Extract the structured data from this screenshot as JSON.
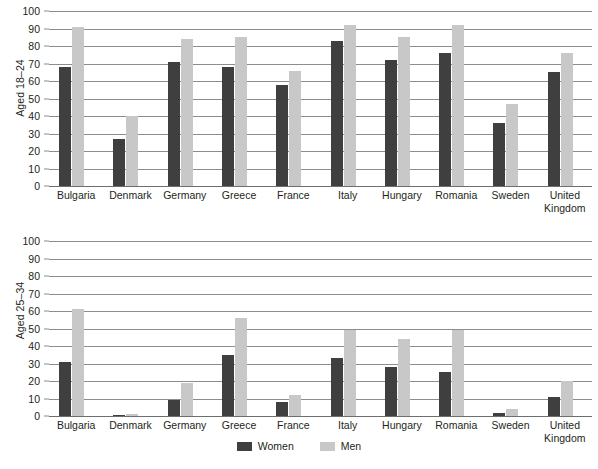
{
  "chart_data": [
    {
      "type": "bar",
      "title": "",
      "ylabel": "Aged 18–24",
      "xlabel": "",
      "ylim": [
        0,
        100
      ],
      "yticks": [
        0,
        10,
        20,
        30,
        40,
        50,
        60,
        70,
        80,
        90,
        100
      ],
      "grid": true,
      "categories": [
        "Bulgaria",
        "Denmark",
        "Germany",
        "Greece",
        "France",
        "Italy",
        "Hungary",
        "Romania",
        "Sweden",
        "United Kingdom"
      ],
      "series": [
        {
          "name": "Women",
          "color": "#3f3f3f",
          "values": [
            68,
            27,
            71,
            68,
            58,
            83,
            72,
            76,
            36,
            65
          ]
        },
        {
          "name": "Men",
          "color": "#c8c8c8",
          "values": [
            91,
            40,
            84,
            85,
            66,
            92,
            85,
            92,
            47,
            76
          ]
        }
      ]
    },
    {
      "type": "bar",
      "title": "",
      "ylabel": "Aged 25–34",
      "xlabel": "",
      "ylim": [
        0,
        100
      ],
      "yticks": [
        0,
        10,
        20,
        30,
        40,
        50,
        60,
        70,
        80,
        90,
        100
      ],
      "grid": true,
      "categories": [
        "Bulgaria",
        "Denmark",
        "Germany",
        "Greece",
        "France",
        "Italy",
        "Hungary",
        "Romania",
        "Sweden",
        "United Kingdom"
      ],
      "series": [
        {
          "name": "Women",
          "color": "#3f3f3f",
          "values": [
            31,
            0.5,
            9,
            35,
            8,
            33,
            28,
            25,
            2,
            11
          ]
        },
        {
          "name": "Men",
          "color": "#c8c8c8",
          "values": [
            61,
            1,
            19,
            56,
            12,
            49,
            44,
            49,
            4,
            20
          ]
        }
      ]
    }
  ],
  "legend": {
    "position": "bottom-center",
    "items": [
      {
        "label": "Women",
        "color": "#3f3f3f"
      },
      {
        "label": "Men",
        "color": "#c8c8c8"
      }
    ]
  }
}
